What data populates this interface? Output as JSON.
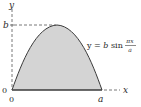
{
  "figure": {
    "axis_labels": {
      "x": "x",
      "y": "y"
    },
    "ticks": {
      "origin_left": "0",
      "origin_bottom": "0",
      "x_end": "a",
      "y_peak": "b"
    },
    "equation": {
      "lhs": "y = ",
      "coef": "b",
      "func": " sin ",
      "numerator": "πx",
      "denominator": "a"
    },
    "colors": {
      "fill": "#d4d4d4",
      "stroke": "#3a3a3a",
      "dash": "#555555"
    }
  }
}
